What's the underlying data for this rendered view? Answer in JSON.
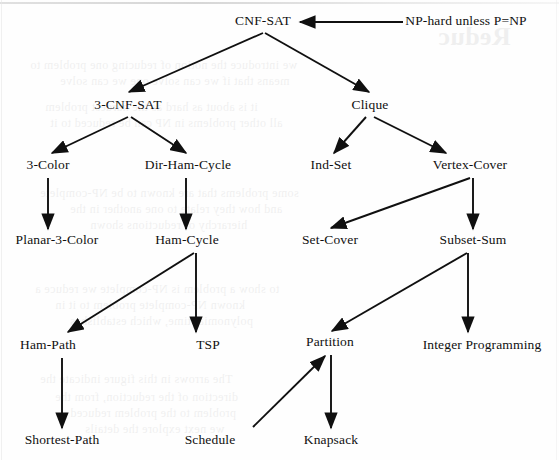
{
  "figure": {
    "kind": "np-complete-reduction-tree",
    "ink_color": "#101010",
    "page_color": "#fefefe",
    "annotation": {
      "text": "NP-hard unless P=NP",
      "x": 466,
      "y": 21
    }
  },
  "nodes": [
    {
      "id": "cnf-sat",
      "label": "CNF-SAT",
      "x": 263,
      "y": 21
    },
    {
      "id": "3-cnf-sat",
      "label": "3-CNF-SAT",
      "x": 128,
      "y": 105
    },
    {
      "id": "clique",
      "label": "Clique",
      "x": 370,
      "y": 105
    },
    {
      "id": "3-color",
      "label": "3-Color",
      "x": 48,
      "y": 165
    },
    {
      "id": "dir-ham-cycle",
      "label": "Dir-Ham-Cycle",
      "x": 188,
      "y": 165
    },
    {
      "id": "ind-set",
      "label": "Ind-Set",
      "x": 331,
      "y": 165
    },
    {
      "id": "vertex-cover",
      "label": "Vertex-Cover",
      "x": 470,
      "y": 165
    },
    {
      "id": "planar-3-color",
      "label": "Planar-3-Color",
      "x": 57,
      "y": 240
    },
    {
      "id": "ham-cycle",
      "label": "Ham-Cycle",
      "x": 187,
      "y": 240
    },
    {
      "id": "set-cover",
      "label": "Set-Cover",
      "x": 330,
      "y": 240
    },
    {
      "id": "subset-sum",
      "label": "Subset-Sum",
      "x": 473,
      "y": 240
    },
    {
      "id": "ham-path",
      "label": "Ham-Path",
      "x": 48,
      "y": 345
    },
    {
      "id": "tsp",
      "label": "TSP",
      "x": 208,
      "y": 345
    },
    {
      "id": "partition",
      "label": "Partition",
      "x": 330,
      "y": 342
    },
    {
      "id": "integer-programming",
      "label": "Integer Programming",
      "x": 482,
      "y": 345
    },
    {
      "id": "shortest-path",
      "label": "Shortest-Path",
      "x": 62,
      "y": 440
    },
    {
      "id": "schedule",
      "label": "Schedule",
      "x": 210,
      "y": 440
    },
    {
      "id": "knapsack",
      "label": "Knapsack",
      "x": 331,
      "y": 440
    }
  ],
  "edges": [
    {
      "id": "np-hard-to-cnf-sat",
      "from": "np-hard-label",
      "to": "cnf-sat",
      "x1": 403,
      "y1": 22,
      "x2": 300,
      "y2": 22
    },
    {
      "id": "cnf-sat-to-3-cnf-sat",
      "from": "cnf-sat",
      "to": "3-cnf-sat",
      "x1": 263,
      "y1": 33,
      "x2": 129,
      "y2": 92
    },
    {
      "id": "cnf-sat-to-clique",
      "from": "cnf-sat",
      "to": "clique",
      "x1": 265,
      "y1": 33,
      "x2": 369,
      "y2": 92
    },
    {
      "id": "3-cnf-sat-to-3-color",
      "from": "3-cnf-sat",
      "to": "3-color",
      "x1": 128,
      "y1": 117,
      "x2": 52,
      "y2": 153
    },
    {
      "id": "3-cnf-sat-to-dir-ham-cycle",
      "from": "3-cnf-sat",
      "to": "dir-ham-cycle",
      "x1": 131,
      "y1": 117,
      "x2": 186,
      "y2": 153
    },
    {
      "id": "clique-to-ind-set",
      "from": "clique",
      "to": "ind-set",
      "x1": 366,
      "y1": 117,
      "x2": 334,
      "y2": 153
    },
    {
      "id": "clique-to-vertex-cover",
      "from": "clique",
      "to": "vertex-cover",
      "x1": 374,
      "y1": 117,
      "x2": 446,
      "y2": 153
    },
    {
      "id": "3-color-to-planar-3-color",
      "from": "3-color",
      "to": "planar-3-color",
      "x1": 48,
      "y1": 178,
      "x2": 48,
      "y2": 229
    },
    {
      "id": "dir-ham-cycle-to-ham-cycle",
      "from": "dir-ham-cycle",
      "to": "ham-cycle",
      "x1": 186,
      "y1": 178,
      "x2": 186,
      "y2": 229
    },
    {
      "id": "vertex-cover-to-set-cover",
      "from": "vertex-cover",
      "to": "set-cover",
      "x1": 470,
      "y1": 178,
      "x2": 331,
      "y2": 228
    },
    {
      "id": "vertex-cover-to-subset-sum",
      "from": "vertex-cover",
      "to": "subset-sum",
      "x1": 473,
      "y1": 178,
      "x2": 473,
      "y2": 229
    },
    {
      "id": "ham-cycle-to-ham-path",
      "from": "ham-cycle",
      "to": "ham-path",
      "x1": 194,
      "y1": 253,
      "x2": 68,
      "y2": 332
    },
    {
      "id": "ham-cycle-to-tsp",
      "from": "ham-cycle",
      "to": "tsp",
      "x1": 196,
      "y1": 253,
      "x2": 196,
      "y2": 332
    },
    {
      "id": "subset-sum-to-partition",
      "from": "subset-sum",
      "to": "partition",
      "x1": 467,
      "y1": 253,
      "x2": 332,
      "y2": 331
    },
    {
      "id": "subset-sum-to-int-prog",
      "from": "subset-sum",
      "to": "integer-programming",
      "x1": 468,
      "y1": 253,
      "x2": 468,
      "y2": 332
    },
    {
      "id": "ham-path-to-shortest-path",
      "from": "ham-path",
      "to": "shortest-path",
      "x1": 62,
      "y1": 358,
      "x2": 62,
      "y2": 428
    },
    {
      "id": "schedule-to-partition",
      "from": "schedule",
      "to": "partition",
      "x1": 253,
      "y1": 427,
      "x2": 325,
      "y2": 356
    },
    {
      "id": "partition-to-knapsack",
      "from": "partition",
      "to": "knapsack",
      "x1": 331,
      "y1": 355,
      "x2": 331,
      "y2": 428
    }
  ],
  "ghost_text": [
    {
      "text": "Reduc",
      "x": 438,
      "y": 22,
      "size": 26,
      "weight": "bold"
    },
    {
      "text": "we introduce the notion of reducing one problem to",
      "x": 30,
      "y": 58,
      "size": 12
    },
    {
      "text": "means that if we can solve one we can solve",
      "x": 60,
      "y": 74,
      "size": 12
    },
    {
      "text": "it is about as hard as the hardest problem",
      "x": 45,
      "y": 100,
      "size": 12
    },
    {
      "text": "all other problems in NP can be reduced to it",
      "x": 50,
      "y": 116,
      "size": 12
    },
    {
      "text": "some problems that are known to be NP-complete",
      "x": 40,
      "y": 186,
      "size": 12
    },
    {
      "text": "and how they relate to one another in the",
      "x": 70,
      "y": 202,
      "size": 12
    },
    {
      "text": "hierarchy of reductions shown",
      "x": 90,
      "y": 218,
      "size": 12
    },
    {
      "text": "to show a problem is NP-complete we reduce a",
      "x": 35,
      "y": 282,
      "size": 12
    },
    {
      "text": "known NP-complete problem to it in",
      "x": 55,
      "y": 298,
      "size": 12
    },
    {
      "text": "polynomial time, which establishes",
      "x": 70,
      "y": 314,
      "size": 12
    },
    {
      "text": "The arrows in this figure indicate the",
      "x": 40,
      "y": 372,
      "size": 12
    },
    {
      "text": "direction of the reduction, from the",
      "x": 55,
      "y": 390,
      "size": 12
    },
    {
      "text": "problem to the problem reduced",
      "x": 70,
      "y": 406,
      "size": 12
    },
    {
      "text": "we next explore the details",
      "x": 85,
      "y": 422,
      "size": 12
    }
  ]
}
